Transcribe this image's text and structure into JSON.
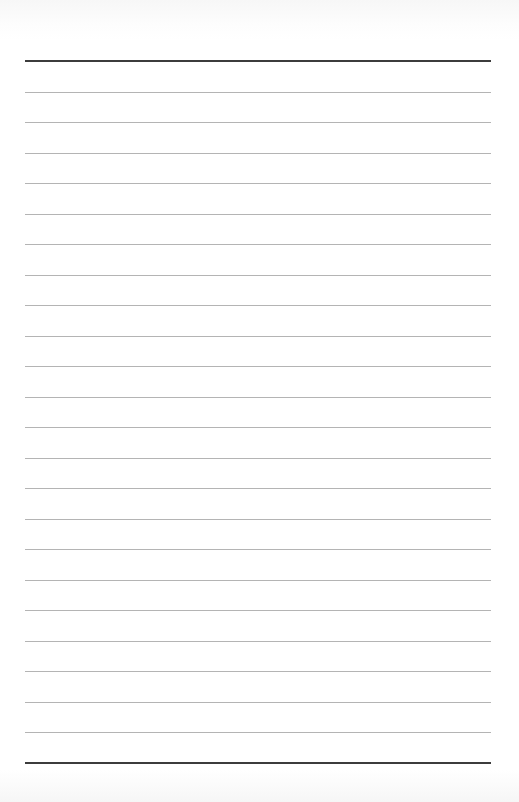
{
  "page": {
    "type": "lined-paper",
    "background": "#ffffff",
    "rule_color": "#b4b4b4",
    "border_rule_color": "#3c3c3c",
    "top_rule_y": 61,
    "bottom_rule_y": 763,
    "line_spacing": 30.52,
    "thin_rule_count": 22
  }
}
